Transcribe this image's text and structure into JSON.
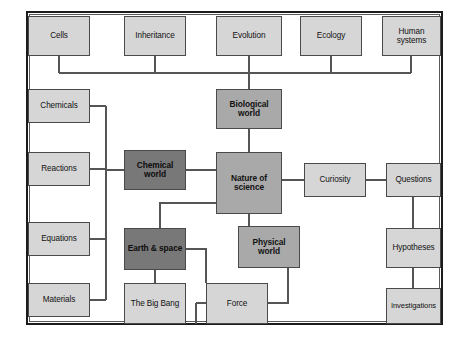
{
  "diagram": {
    "type": "concept-map",
    "canvas": {
      "width": 464,
      "height": 358
    },
    "frame": {
      "x": 26,
      "y": 11,
      "width": 417,
      "height": 314
    },
    "palette": {
      "light": "#d6d6d6",
      "mid": "#a9a9a9",
      "dark": "#787878",
      "border": "#4a4a4a",
      "frame": "#1c1c1c",
      "line": "#555555",
      "background": "#ffffff"
    },
    "nodes": [
      {
        "id": "cells",
        "label": "Cells",
        "shade": "light",
        "x": 28,
        "y": 16,
        "w": 62,
        "h": 40
      },
      {
        "id": "inheritance",
        "label": "Inheritance",
        "shade": "light",
        "x": 124,
        "y": 16,
        "w": 62,
        "h": 40
      },
      {
        "id": "evolution",
        "label": "Evolution",
        "shade": "light",
        "x": 216,
        "y": 16,
        "w": 66,
        "h": 40
      },
      {
        "id": "ecology",
        "label": "Ecology",
        "shade": "light",
        "x": 300,
        "y": 16,
        "w": 62,
        "h": 40
      },
      {
        "id": "human-systems",
        "label": "Human systems",
        "shade": "light",
        "x": 382,
        "y": 16,
        "w": 59,
        "h": 40
      },
      {
        "id": "biological-world",
        "label": "Biological world",
        "shade": "mid",
        "x": 216,
        "y": 89,
        "w": 66,
        "h": 40
      },
      {
        "id": "chemicals",
        "label": "Chemicals",
        "shade": "light",
        "x": 28,
        "y": 89,
        "w": 62,
        "h": 34
      },
      {
        "id": "reactions",
        "label": "Reactions",
        "shade": "light",
        "x": 28,
        "y": 152,
        "w": 62,
        "h": 34
      },
      {
        "id": "equations",
        "label": "Equations",
        "shade": "light",
        "x": 28,
        "y": 222,
        "w": 62,
        "h": 34
      },
      {
        "id": "materials",
        "label": "Materials",
        "shade": "light",
        "x": 28,
        "y": 283,
        "w": 62,
        "h": 34
      },
      {
        "id": "chemical-world",
        "label": "Chemical world",
        "shade": "dark",
        "x": 124,
        "y": 150,
        "w": 62,
        "h": 40
      },
      {
        "id": "nature-of-science",
        "label": "Nature of science",
        "shade": "mid",
        "x": 216,
        "y": 152,
        "w": 66,
        "h": 62
      },
      {
        "id": "curiosity",
        "label": "Curiosity",
        "shade": "light",
        "x": 304,
        "y": 163,
        "w": 62,
        "h": 34
      },
      {
        "id": "questions",
        "label": "Questions",
        "shade": "light",
        "x": 386,
        "y": 163,
        "w": 55,
        "h": 34
      },
      {
        "id": "hypotheses",
        "label": "Hypotheses",
        "shade": "light",
        "x": 386,
        "y": 228,
        "w": 55,
        "h": 40
      },
      {
        "id": "investigations",
        "label": "Investigations",
        "shade": "light",
        "x": 386,
        "y": 288,
        "w": 55,
        "h": 36
      },
      {
        "id": "earth-and-space",
        "label": "Earth & space",
        "shade": "dark",
        "x": 124,
        "y": 228,
        "w": 62,
        "h": 42
      },
      {
        "id": "physical-world",
        "label": "Physical world",
        "shade": "mid",
        "x": 238,
        "y": 226,
        "w": 62,
        "h": 42
      },
      {
        "id": "the-big-bang",
        "label": "The Big Bang",
        "shade": "light",
        "x": 124,
        "y": 283,
        "w": 62,
        "h": 41
      },
      {
        "id": "force",
        "label": "Force",
        "shade": "light",
        "x": 206,
        "y": 283,
        "w": 62,
        "h": 41
      }
    ],
    "edges": [
      {
        "from": "cells",
        "to": "bus-top"
      },
      {
        "from": "inheritance",
        "to": "bus-top"
      },
      {
        "from": "evolution",
        "to": "bus-top"
      },
      {
        "from": "ecology",
        "to": "bus-top"
      },
      {
        "from": "human-systems",
        "to": "bus-top"
      },
      {
        "from": "bus-top",
        "to": "biological-world"
      },
      {
        "from": "biological-world",
        "to": "nature-of-science"
      },
      {
        "from": "chemicals",
        "to": "bus-left"
      },
      {
        "from": "reactions",
        "to": "bus-left"
      },
      {
        "from": "equations",
        "to": "bus-left"
      },
      {
        "from": "materials",
        "to": "bus-left"
      },
      {
        "from": "bus-left",
        "to": "chemical-world"
      },
      {
        "from": "chemical-world",
        "to": "nature-of-science"
      },
      {
        "from": "nature-of-science",
        "to": "curiosity"
      },
      {
        "from": "curiosity",
        "to": "questions"
      },
      {
        "from": "questions",
        "to": "hypotheses"
      },
      {
        "from": "hypotheses",
        "to": "investigations"
      },
      {
        "from": "nature-of-science",
        "to": "earth-and-space"
      },
      {
        "from": "nature-of-science",
        "to": "physical-world"
      },
      {
        "from": "earth-and-space",
        "to": "the-big-bang"
      },
      {
        "from": "earth-and-space",
        "to": "force"
      },
      {
        "from": "physical-world",
        "to": "force"
      }
    ]
  }
}
